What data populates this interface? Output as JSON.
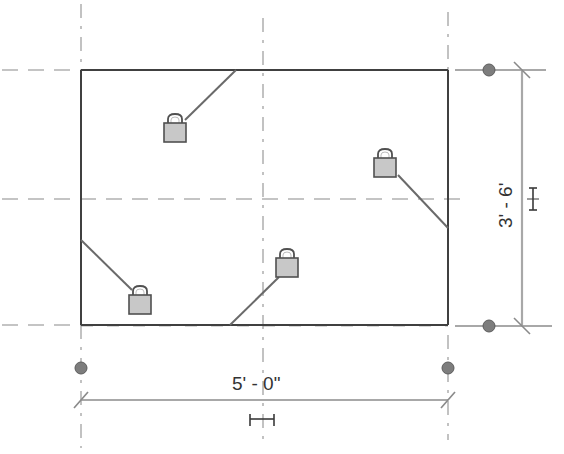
{
  "diagram": {
    "type": "cad-sketch",
    "rectangle": {
      "x1": 81,
      "y1": 70,
      "x2": 448,
      "y2": 325
    },
    "colors": {
      "edge": "#404040",
      "reference_plane": "#8a8a8a",
      "dimension": "#a8a8a8",
      "lock_fill": "#c8c8c8",
      "grip": "#7d7d7d",
      "text": "#333333"
    }
  },
  "dimensions": {
    "width": {
      "label": "5' - 0\"",
      "orientation": "horizontal"
    },
    "height": {
      "label": "3' - 6'",
      "orientation": "vertical"
    }
  },
  "constraints": {
    "locks": [
      {
        "name": "lock-top",
        "icon": "padlock-icon",
        "state": "locked"
      },
      {
        "name": "lock-right",
        "icon": "padlock-icon",
        "state": "locked"
      },
      {
        "name": "lock-bottom",
        "icon": "padlock-icon",
        "state": "locked"
      },
      {
        "name": "lock-left",
        "icon": "padlock-icon",
        "state": "locked"
      }
    ],
    "equality": [
      {
        "name": "eq-horizontal",
        "icon": "equality-constraint-icon"
      },
      {
        "name": "eq-vertical",
        "icon": "equality-constraint-icon"
      }
    ]
  },
  "grips": [
    {
      "name": "grip-top-right"
    },
    {
      "name": "grip-bottom-right"
    },
    {
      "name": "grip-bottom-left"
    },
    {
      "name": "grip-bottom-right-lower"
    }
  ]
}
